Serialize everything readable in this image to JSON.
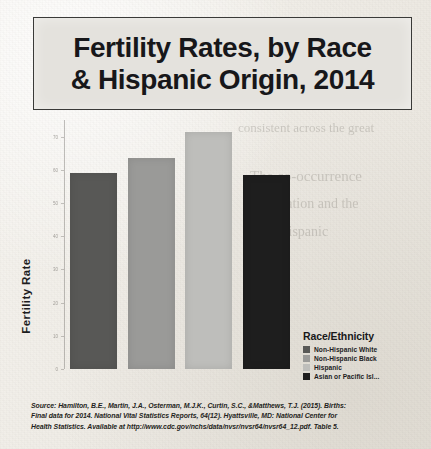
{
  "title": {
    "line1": "Fertility Rates, by Race",
    "line2": "& Hispanic Origin, 2014"
  },
  "chart_data": {
    "type": "bar",
    "title": "Fertility Rates, by Race & Hispanic Origin, 2014",
    "xlabel": "",
    "ylabel": "Fertility Rate",
    "grid": false,
    "legend_position": "right",
    "ylim": [
      0,
      75
    ],
    "categories": [
      "Non-Hispanic White",
      "Non-Hispanic Black",
      "Hispanic",
      "Asian or Pacific Islander"
    ],
    "values": [
      59,
      63.5,
      71.5,
      58.5
    ],
    "colors": [
      "#585856",
      "#9a9a98",
      "#bebebb",
      "#1e1e1e"
    ],
    "ytick_labels": [
      "0",
      "10",
      "20",
      "30",
      "40",
      "50",
      "60",
      "70"
    ],
    "ytick_values": [
      0,
      10,
      20,
      30,
      40,
      50,
      60,
      70
    ]
  },
  "legend": {
    "title": "Race/Ethnicity",
    "items": [
      {
        "label": "Non-Hispanic White",
        "color": "#585856"
      },
      {
        "label": "Non-Hispanic Black",
        "color": "#9a9a98"
      },
      {
        "label": "Hispanic",
        "color": "#bebebb"
      },
      {
        "label": "Asian or Pacific Isl...",
        "color": "#1e1e1e"
      }
    ]
  },
  "source": {
    "line1": "Source: Hamilton, B.E., Martin, J.A., Osterman, M.J.K., Curtin, S.C., &Matthews, T.J. (2015). Births:",
    "line2": "Final data for 2014. National Vital Statistics Reports, 64(12). Hyattsville, MD: National Center for",
    "line3": "Health Statistics. Available at http://www.cdc.gov/nchs/data/nvsr/nvsr64/nvsr64_12.pdf. Table 5."
  },
  "ghost_text": {
    "g1": "consistent across the great",
    "g2": "The co-occurrence",
    "g3": "association and the",
    "g4": "with Hispanic"
  }
}
